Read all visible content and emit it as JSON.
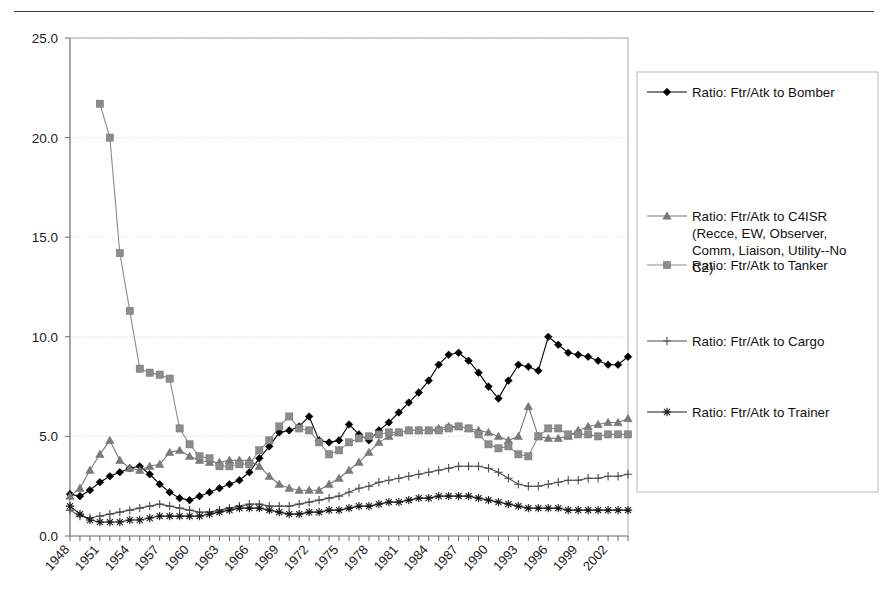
{
  "page": {
    "background_color": "#ffffff",
    "rule_color": "#3a3a3a"
  },
  "axes": {
    "y_ticks": [
      "0.0",
      "5.0",
      "10.0",
      "15.0",
      "20.0",
      "25.0"
    ],
    "x_ticks": [
      "1948",
      "1951",
      "1954",
      "1957",
      "1960",
      "1963",
      "1966",
      "1969",
      "1972",
      "1975",
      "1978",
      "1981",
      "1984",
      "1987",
      "1990",
      "1993",
      "1996",
      "1999",
      "2002"
    ],
    "axis_color": "#6b6b6b",
    "grid_color": "#c9c9c9"
  },
  "legend": {
    "border_color": "#b0b0b0",
    "entries": [
      {
        "label": "Ratio: Ftr/Atk to Bomber",
        "marker": "diamond",
        "color": "#000000"
      },
      {
        "label": "Ratio: Ftr/Atk to C4ISR (Recce, EW, Observer, Comm, Liaison, Utility--No C2)",
        "marker": "triangle",
        "color": "#7a7a7a"
      },
      {
        "label": "Ratio: Ftr/Atk to Tanker",
        "marker": "square",
        "color": "#8c8c8c"
      },
      {
        "label": "Ratio: Ftr/Atk to Cargo",
        "marker": "plus",
        "color": "#4d4d4d"
      },
      {
        "label": "Ratio: Ftr/Atk to Trainer",
        "marker": "asterisk",
        "color": "#1a1a1a"
      }
    ]
  },
  "chart_data": {
    "type": "line",
    "title": "",
    "xlabel": "",
    "ylabel": "",
    "xlim": [
      1948,
      2004
    ],
    "ylim": [
      0,
      25
    ],
    "y_tick_step": 5,
    "x_tick_step": 3,
    "grid": "horizontal",
    "legend_position": "right",
    "x": [
      1948,
      1949,
      1950,
      1951,
      1952,
      1953,
      1954,
      1955,
      1956,
      1957,
      1958,
      1959,
      1960,
      1961,
      1962,
      1963,
      1964,
      1965,
      1966,
      1967,
      1968,
      1969,
      1970,
      1971,
      1972,
      1973,
      1974,
      1975,
      1976,
      1977,
      1978,
      1979,
      1980,
      1981,
      1982,
      1983,
      1984,
      1985,
      1986,
      1987,
      1988,
      1989,
      1990,
      1991,
      1992,
      1993,
      1994,
      1995,
      1996,
      1997,
      1998,
      1999,
      2000,
      2001,
      2002,
      2003,
      2004
    ],
    "series": [
      {
        "name": "Ratio: Ftr/Atk to Bomber",
        "marker": "diamond",
        "color": "#000000",
        "values": [
          2.1,
          2.0,
          2.3,
          2.7,
          3.0,
          3.2,
          3.4,
          3.5,
          3.1,
          2.6,
          2.2,
          1.9,
          1.8,
          2.0,
          2.2,
          2.4,
          2.6,
          2.8,
          3.2,
          3.9,
          4.5,
          5.2,
          5.3,
          5.5,
          6.0,
          4.8,
          4.7,
          4.8,
          5.6,
          5.1,
          4.8,
          5.3,
          5.7,
          6.2,
          6.7,
          7.2,
          7.8,
          8.6,
          9.1,
          9.2,
          8.8,
          8.2,
          7.5,
          6.9,
          7.8,
          8.6,
          8.5,
          8.3,
          10.0,
          9.6,
          9.2,
          9.1,
          9.0,
          8.8,
          8.6,
          8.6,
          9.0
        ]
      },
      {
        "name": "Ratio: Ftr/Atk to C4ISR (Recce, EW, Observer, Comm, Liaison, Utility--No C2)",
        "marker": "triangle",
        "color": "#7a7a7a",
        "values": [
          2.0,
          2.4,
          3.3,
          4.1,
          4.8,
          3.8,
          3.4,
          3.3,
          3.5,
          3.6,
          4.2,
          4.3,
          4.0,
          3.8,
          3.7,
          3.7,
          3.8,
          3.8,
          3.8,
          3.5,
          3.0,
          2.6,
          2.4,
          2.3,
          2.3,
          2.3,
          2.6,
          2.9,
          3.3,
          3.7,
          4.2,
          4.7,
          5.0,
          5.2,
          5.3,
          5.3,
          5.3,
          5.4,
          5.5,
          5.5,
          5.4,
          5.3,
          5.2,
          5.0,
          4.8,
          5.0,
          6.5,
          5.0,
          4.9,
          4.9,
          5.0,
          5.3,
          5.5,
          5.6,
          5.7,
          5.7,
          5.9
        ]
      },
      {
        "name": "Ratio: Ftr/Atk to Tanker",
        "marker": "square",
        "color": "#8c8c8c",
        "values": [
          null,
          null,
          null,
          21.7,
          20.0,
          14.2,
          11.3,
          8.4,
          8.2,
          8.1,
          7.9,
          5.4,
          4.6,
          4.0,
          3.9,
          3.5,
          3.5,
          3.6,
          3.6,
          4.3,
          4.8,
          5.5,
          6.0,
          5.4,
          5.3,
          4.7,
          4.1,
          4.3,
          4.7,
          4.9,
          5.0,
          5.1,
          5.2,
          5.2,
          5.3,
          5.3,
          5.3,
          5.3,
          5.4,
          5.5,
          5.4,
          5.1,
          4.6,
          4.4,
          4.5,
          4.1,
          4.0,
          5.0,
          5.4,
          5.4,
          5.1,
          5.1,
          5.1,
          5.0,
          5.1,
          5.1,
          5.1
        ]
      },
      {
        "name": "Ratio: Ftr/Atk to Cargo",
        "marker": "plus",
        "color": "#4d4d4d",
        "values": [
          1.3,
          1.0,
          0.9,
          1.0,
          1.1,
          1.2,
          1.3,
          1.4,
          1.5,
          1.6,
          1.5,
          1.4,
          1.3,
          1.2,
          1.2,
          1.3,
          1.4,
          1.5,
          1.6,
          1.6,
          1.5,
          1.5,
          1.5,
          1.6,
          1.7,
          1.8,
          1.9,
          2.0,
          2.2,
          2.4,
          2.5,
          2.7,
          2.8,
          2.9,
          3.0,
          3.1,
          3.2,
          3.3,
          3.4,
          3.5,
          3.5,
          3.5,
          3.4,
          3.2,
          2.9,
          2.6,
          2.5,
          2.5,
          2.6,
          2.7,
          2.8,
          2.8,
          2.9,
          2.9,
          3.0,
          3.0,
          3.1
        ]
      },
      {
        "name": "Ratio: Ftr/Atk to Trainer",
        "marker": "asterisk",
        "color": "#1a1a1a",
        "values": [
          1.5,
          1.1,
          0.8,
          0.7,
          0.7,
          0.7,
          0.8,
          0.8,
          0.9,
          1.0,
          1.0,
          1.0,
          1.0,
          1.0,
          1.1,
          1.2,
          1.3,
          1.4,
          1.4,
          1.4,
          1.3,
          1.2,
          1.1,
          1.1,
          1.2,
          1.2,
          1.3,
          1.3,
          1.4,
          1.5,
          1.5,
          1.6,
          1.7,
          1.7,
          1.8,
          1.9,
          1.9,
          2.0,
          2.0,
          2.0,
          2.0,
          1.9,
          1.8,
          1.7,
          1.6,
          1.5,
          1.4,
          1.4,
          1.4,
          1.4,
          1.3,
          1.3,
          1.3,
          1.3,
          1.3,
          1.3,
          1.3
        ]
      }
    ]
  }
}
